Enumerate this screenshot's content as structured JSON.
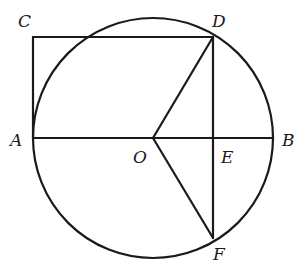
{
  "diagram": {
    "type": "geometry",
    "points": {
      "A": {
        "label": "A",
        "x": 33,
        "y": 138
      },
      "B": {
        "label": "B",
        "x": 273,
        "y": 138
      },
      "C": {
        "label": "C",
        "x": 33,
        "y": 37
      },
      "D": {
        "label": "D",
        "x": 213,
        "y": 37
      },
      "O": {
        "label": "O",
        "x": 153,
        "y": 138
      },
      "E": {
        "label": "E",
        "x": 213,
        "y": 138
      },
      "F": {
        "label": "F",
        "x": 213,
        "y": 238
      }
    },
    "circle": {
      "center": "O",
      "radius": 120
    },
    "segments": [
      "AB",
      "CA",
      "CD",
      "DF",
      "OD",
      "OF"
    ],
    "stroke_color": "#1a1a1a",
    "background": "#ffffff"
  }
}
